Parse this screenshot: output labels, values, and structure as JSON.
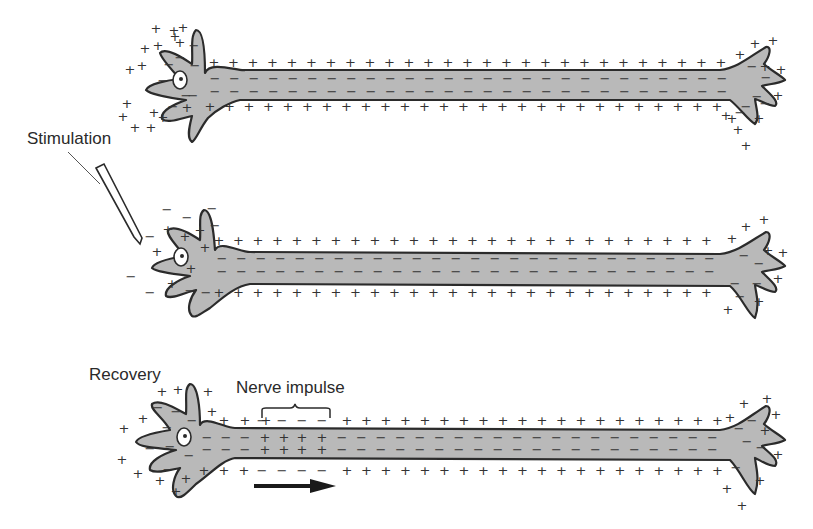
{
  "labels": {
    "stimulation": "Stimulation",
    "recovery": "Recovery",
    "nerve_impulse": "Nerve impulse"
  },
  "colors": {
    "cell_fill": "#b9b9b9",
    "outline": "#2b2b2b",
    "text": "#2a2a2a",
    "arrow": "#1a1a1a"
  },
  "panels": [
    {
      "id": "resting",
      "description": "Resting neuron: outside positive, inside negative along entire membrane"
    },
    {
      "id": "stimulated",
      "description": "Stimulation at cell body reverses polarity locally (inside +, outside −)"
    },
    {
      "id": "propagating",
      "description": "Nerve impulse (reversed polarity zone) travels right along axon; cell body in recovery"
    }
  ],
  "symbols": {
    "plus": "+",
    "minus": "−"
  }
}
